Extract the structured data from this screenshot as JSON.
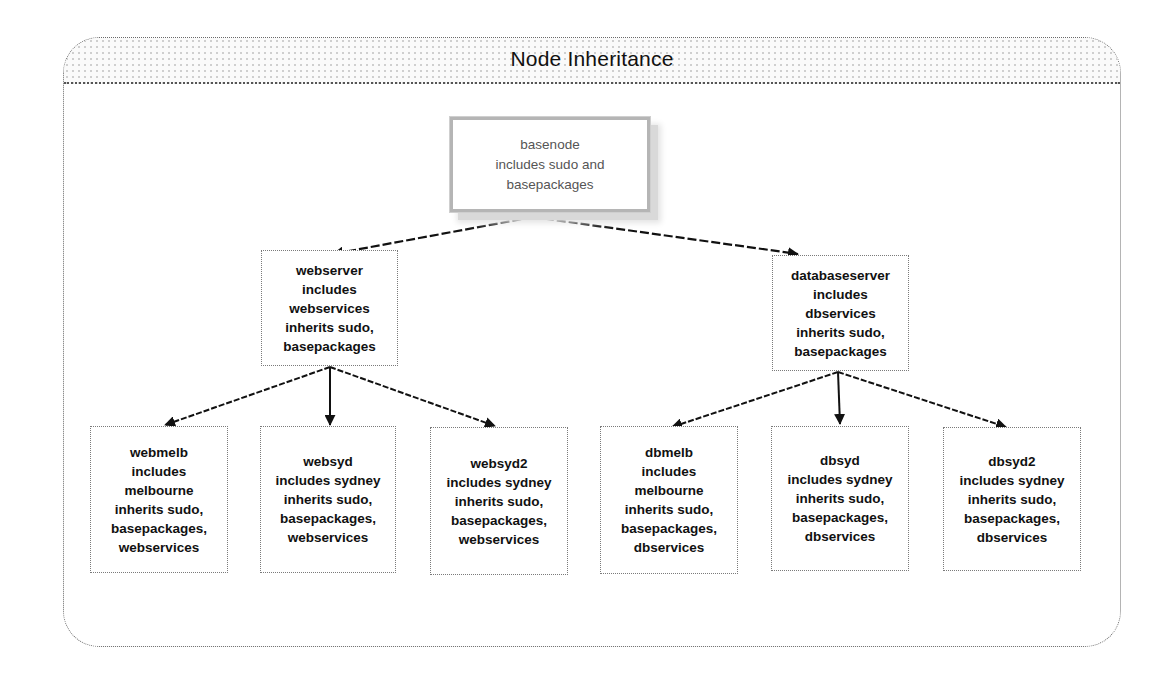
{
  "diagram": {
    "title": "Node Inheritance",
    "nodes": {
      "basenode": {
        "lines": [
          "basenode",
          "includes sudo and",
          "basepackages"
        ]
      },
      "webserver": {
        "lines": [
          "webserver",
          "includes",
          "webservices",
          "inherits sudo,",
          "basepackages"
        ]
      },
      "databaseserver": {
        "lines": [
          "databaseserver",
          "includes",
          "dbservices",
          "inherits sudo,",
          "basepackages"
        ]
      },
      "webmelb": {
        "lines": [
          "webmelb",
          "includes",
          "melbourne",
          "inherits sudo,",
          "basepackages,",
          "webservices"
        ]
      },
      "websyd": {
        "lines": [
          "websyd",
          "includes sydney",
          "inherits sudo,",
          "basepackages,",
          "webservices"
        ]
      },
      "websyd2": {
        "lines": [
          "websyd2",
          "includes sydney",
          "inherits sudo,",
          "basepackages,",
          "webservices"
        ]
      },
      "dbmelb": {
        "lines": [
          "dbmelb",
          "includes",
          "melbourne",
          "inherits sudo,",
          "basepackages,",
          "dbservices"
        ]
      },
      "dbsyd": {
        "lines": [
          "dbsyd",
          "includes sydney",
          "inherits sudo,",
          "basepackages,",
          "dbservices"
        ]
      },
      "dbsyd2": {
        "lines": [
          "dbsyd2",
          "includes sydney",
          "inherits sudo,",
          "basepackages,",
          "dbservices"
        ]
      }
    },
    "edges": [
      {
        "from": "basenode",
        "to": "webserver"
      },
      {
        "from": "basenode",
        "to": "databaseserver"
      },
      {
        "from": "webserver",
        "to": "webmelb"
      },
      {
        "from": "webserver",
        "to": "websyd"
      },
      {
        "from": "webserver",
        "to": "websyd2"
      },
      {
        "from": "databaseserver",
        "to": "dbmelb"
      },
      {
        "from": "databaseserver",
        "to": "dbsyd"
      },
      {
        "from": "databaseserver",
        "to": "dbsyd2"
      }
    ],
    "colors": {
      "frame_border": "#6a6a6a",
      "root_border": "#b5b5b5",
      "node_border": "#7a7a7a",
      "edge": "#111111"
    }
  }
}
